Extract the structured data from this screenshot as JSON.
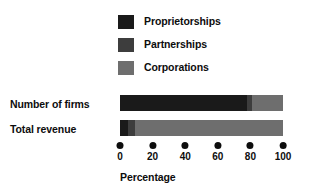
{
  "chart_data": {
    "type": "bar",
    "orientation": "horizontal",
    "stacked": true,
    "title": "",
    "xlabel": "Percentage",
    "ylabel": "",
    "xlim": [
      0,
      100
    ],
    "xticks": [
      0,
      20,
      40,
      60,
      80,
      100
    ],
    "xtick_labels": [
      "0",
      "20",
      "40",
      "60",
      "80",
      "100"
    ],
    "grid": false,
    "legend_position": "top",
    "categories": [
      "Number of firms",
      "Total revenue"
    ],
    "series": [
      {
        "name": "Proprietorships",
        "color": "#1a1a1a",
        "values": [
          78,
          5
        ]
      },
      {
        "name": "Partnerships",
        "color": "#3d3d3d",
        "values": [
          3,
          4
        ]
      },
      {
        "name": "Corporations",
        "color": "#6e6e6e",
        "values": [
          19,
          91
        ]
      }
    ]
  },
  "legend": {
    "items": [
      {
        "label": "Proprietorships",
        "color": "#1a1a1a"
      },
      {
        "label": "Partnerships",
        "color": "#3d3d3d"
      },
      {
        "label": "Corporations",
        "color": "#6e6e6e"
      }
    ]
  },
  "rows": [
    {
      "label": "Number of firms"
    },
    {
      "label": "Total revenue"
    }
  ],
  "axis": {
    "title": "Percentage",
    "ticks": [
      {
        "value": 0,
        "label": "0"
      },
      {
        "value": 20,
        "label": "20"
      },
      {
        "value": 40,
        "label": "40"
      },
      {
        "value": 60,
        "label": "60"
      },
      {
        "value": 80,
        "label": "80"
      },
      {
        "value": 100,
        "label": "100"
      }
    ]
  }
}
